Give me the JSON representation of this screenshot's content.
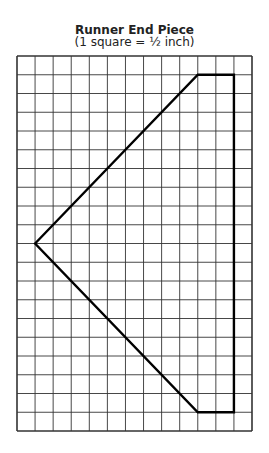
{
  "title": "Runner End Piece",
  "subtitle": "(1 square = ½ inch)",
  "grid": {
    "columns": 13,
    "rows": 20,
    "scale": "1 square = 1/2 inch"
  },
  "shape": {
    "vertices_grid": [
      [
        1,
        10
      ],
      [
        10,
        1
      ],
      [
        12,
        1
      ],
      [
        12,
        19
      ],
      [
        10,
        19
      ]
    ]
  }
}
